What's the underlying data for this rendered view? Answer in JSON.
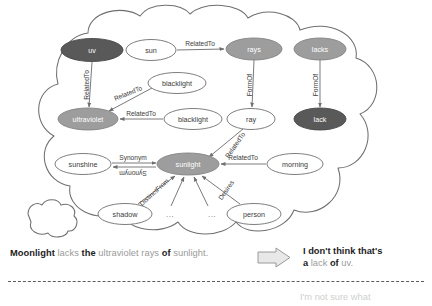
{
  "figure": {
    "type": "knowledge-graph-thought-bubble",
    "palette": {
      "node_dark": "#595959",
      "node_mid": "#9d9d9d",
      "node_plain_fill": "#ffffff",
      "node_stroke": "#6f6f6f",
      "edge": "#7a7a7a",
      "text_dark": "#1d1d1d",
      "text_soft": "#9a9a9a",
      "cloud_stroke": "#6f6f6f",
      "divider": "#5c5c5c",
      "arrow_fill": "#e8e8e8",
      "arrow_stroke": "#9a9a9a"
    },
    "nodes": [
      {
        "id": "uv",
        "label": "uv",
        "style": "dark",
        "cx": 92,
        "cy": 50,
        "rx": 31,
        "ry": 11.5
      },
      {
        "id": "sun",
        "label": "sun",
        "style": "plain",
        "cx": 151,
        "cy": 50,
        "rx": 25,
        "ry": 10.5
      },
      {
        "id": "rays",
        "label": "rays",
        "style": "mid",
        "cx": 254,
        "cy": 49,
        "rx": 28,
        "ry": 11
      },
      {
        "id": "lacks",
        "label": "lacks",
        "style": "mid",
        "cx": 320,
        "cy": 49,
        "rx": 26,
        "ry": 11
      },
      {
        "id": "blacklight1",
        "label": "blacklight",
        "style": "plain",
        "cx": 177,
        "cy": 83,
        "rx": 29,
        "ry": 10.5
      },
      {
        "id": "ultraviolet",
        "label": "ultraviolet",
        "style": "mid",
        "cx": 88,
        "cy": 119,
        "rx": 30,
        "ry": 11
      },
      {
        "id": "blacklight2",
        "label": "blacklight",
        "style": "plain",
        "cx": 193,
        "cy": 119,
        "rx": 29,
        "ry": 10.5
      },
      {
        "id": "ray",
        "label": "ray",
        "style": "plain",
        "cx": 251,
        "cy": 119,
        "rx": 24,
        "ry": 10.5
      },
      {
        "id": "lack",
        "label": "lack",
        "style": "dark",
        "cx": 320,
        "cy": 119,
        "rx": 26,
        "ry": 11
      },
      {
        "id": "sunshine",
        "label": "sunshine",
        "style": "plain",
        "cx": 83,
        "cy": 164,
        "rx": 28,
        "ry": 10.5
      },
      {
        "id": "sunlight",
        "label": "sunlight",
        "style": "mid",
        "cx": 188,
        "cy": 164,
        "rx": 31,
        "ry": 11
      },
      {
        "id": "morning",
        "label": "morning",
        "style": "plain",
        "cx": 295,
        "cy": 164,
        "rx": 28,
        "ry": 10.5
      },
      {
        "id": "shadow",
        "label": "shadow",
        "style": "plain",
        "cx": 125,
        "cy": 214,
        "rx": 27,
        "ry": 10.5
      },
      {
        "id": "person",
        "label": "person",
        "style": "plain",
        "cx": 254,
        "cy": 214,
        "rx": 27,
        "ry": 10.5
      }
    ],
    "edges": [
      {
        "from": "sun",
        "to": "rays",
        "label": "RelatedTo",
        "label_rotation": 0
      },
      {
        "from": "uv",
        "to": "ultraviolet",
        "label": "RelatedTo",
        "label_rotation": -90
      },
      {
        "from": "blacklight1",
        "to": "ultraviolet",
        "label": "RelatedTo",
        "label_rotation": -22
      },
      {
        "from": "blacklight2",
        "to": "ultraviolet",
        "label": "RelatedTo",
        "label_rotation": 0
      },
      {
        "from": "rays",
        "to": "ray",
        "label": "FormOf",
        "label_rotation": -90
      },
      {
        "from": "lacks",
        "to": "lack",
        "label": "FormOf",
        "label_rotation": -90
      },
      {
        "from": "ray",
        "to": "sunlight",
        "label": "RelatedTo",
        "label_rotation": -55
      },
      {
        "from": "sunshine",
        "to": "sunlight",
        "label": "Synonym",
        "label_rotation": 0
      },
      {
        "from": "sunlight",
        "to": "sunshine",
        "label": "Synonym",
        "label_rotation": 180
      },
      {
        "from": "morning",
        "to": "sunlight",
        "label": "RelatedTo",
        "label_rotation": 0
      },
      {
        "from": "shadow",
        "to": "sunlight",
        "label": "DistinctFrom",
        "label_rotation": -42
      },
      {
        "from": "person",
        "to": "sunlight",
        "label": "Desires",
        "label_rotation": -55
      },
      {
        "from": "ellipsis1",
        "to": "sunlight",
        "label": "",
        "label_rotation": 0
      },
      {
        "from": "ellipsis2",
        "to": "sunlight",
        "label": "",
        "label_rotation": 0
      }
    ],
    "ellipses": [
      {
        "id": "ellipsis1",
        "label": "...",
        "cx": 170,
        "cy": 214
      },
      {
        "id": "ellipsis2",
        "label": "...",
        "cx": 212,
        "cy": 214
      }
    ]
  },
  "caption": {
    "tokens": [
      {
        "text": "Moonlight",
        "emphasis": "bold"
      },
      {
        "text": "lacks",
        "emphasis": "soft"
      },
      {
        "text": "the",
        "emphasis": "bold"
      },
      {
        "text": "ultraviolet rays",
        "emphasis": "soft"
      },
      {
        "text": "of",
        "emphasis": "bold"
      },
      {
        "text": "sunlight.",
        "emphasis": "soft"
      }
    ],
    "full_text": "Moonlight lacks the ultraviolet rays of sunlight."
  },
  "arrow": {
    "name": "right-arrow-icon",
    "direction": "right"
  },
  "reply": {
    "line1_tokens": [
      {
        "text": "I don't think that's",
        "emphasis": "bold"
      }
    ],
    "line2_tokens": [
      {
        "text": "a",
        "emphasis": "bold"
      },
      {
        "text": "lack",
        "emphasis": "soft"
      },
      {
        "text": "of",
        "emphasis": "bold"
      },
      {
        "text": "uv.",
        "emphasis": "soft"
      }
    ],
    "full_text": "I don't think that's a lack of uv."
  },
  "clipped_tail": {
    "text": "I'm not sure what"
  }
}
